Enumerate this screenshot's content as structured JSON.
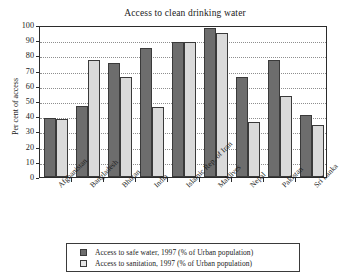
{
  "chart_data": {
    "type": "bar",
    "title": "Access to clean drinking water",
    "xlabel": "",
    "ylabel": "Per cent of access",
    "ylim": [
      0,
      100
    ],
    "ytick_step": 10,
    "yticks": [
      0,
      10,
      20,
      30,
      40,
      50,
      60,
      70,
      80,
      90,
      100
    ],
    "grid": true,
    "legend_position": "below-plot",
    "categories": [
      "Afghanistan",
      "Bangladesh",
      "Bhutan",
      "India",
      "Islamic Rep. of Iran",
      "Maldives",
      "Nepal",
      "Pakistan",
      "Sri Lanka"
    ],
    "series": [
      {
        "name": "Access to safe water, 1997 (% of Urban population)",
        "color": "#6d6d6d",
        "values": [
          39,
          47,
          75,
          85,
          89,
          98,
          66,
          77,
          41
        ]
      },
      {
        "name": "Access to sanitation, 1997 (% of Urban population)",
        "color": "#dadada",
        "values": [
          38,
          77,
          66,
          46,
          89,
          95,
          36,
          53,
          34
        ]
      }
    ]
  },
  "legend": {
    "items": [
      {
        "label": "Access to safe water, 1997 (% of Urban population)",
        "swatch": "dark-gray-swatch"
      },
      {
        "label": "Access to sanitation, 1997 (% of Urban population)",
        "swatch": "light-gray-swatch"
      }
    ]
  },
  "colors": {
    "series_water": "#6d6d6d",
    "series_sanitation": "#dadada",
    "axis": "#2b2b2b",
    "grid": "#8e8e8e",
    "background": "#ffffff",
    "text": "#1a1a1a"
  }
}
